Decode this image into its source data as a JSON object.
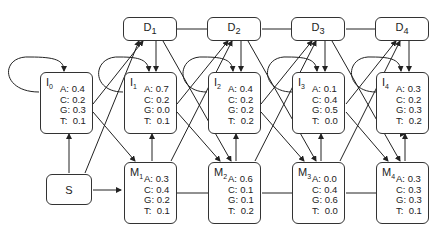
{
  "diagram": {
    "type": "profile-hmm",
    "start": {
      "label": "S"
    },
    "delete_states": [
      {
        "label": "D",
        "sub": "1"
      },
      {
        "label": "D",
        "sub": "2"
      },
      {
        "label": "D",
        "sub": "3"
      },
      {
        "label": "D",
        "sub": "4"
      }
    ],
    "insert_states": [
      {
        "label": "I",
        "sub": "0",
        "probs": {
          "A": "0.4",
          "C": "0.2",
          "G": "0.3",
          "T": "0.1"
        }
      },
      {
        "label": "I",
        "sub": "1",
        "probs": {
          "A": "0.7",
          "C": "0.2",
          "G": "0.0",
          "T": "0.1"
        }
      },
      {
        "label": "I",
        "sub": "2",
        "probs": {
          "A": "0.4",
          "C": "0.2",
          "G": "0.2",
          "T": "0.2"
        }
      },
      {
        "label": "I",
        "sub": "3",
        "probs": {
          "A": "0.1",
          "C": "0.4",
          "G": "0.5",
          "T": "0.0"
        }
      },
      {
        "label": "I",
        "sub": "4",
        "probs": {
          "A": "0.3",
          "C": "0.2",
          "G": "0.3",
          "T": "0.2"
        }
      }
    ],
    "match_states": [
      {
        "label": "M",
        "sub": "1",
        "probs": {
          "A": "0.3",
          "C": "0.4",
          "G": "0.2",
          "T": "0.1"
        }
      },
      {
        "label": "M",
        "sub": "2",
        "probs": {
          "A": "0.6",
          "C": "0.1",
          "G": "0.1",
          "T": "0.2"
        }
      },
      {
        "label": "M",
        "sub": "3",
        "probs": {
          "A": "0.0",
          "C": "0.4",
          "G": "0.6",
          "T": "0.0"
        }
      },
      {
        "label": "M",
        "sub": "4",
        "probs": {
          "A": "0.3",
          "C": "0.3",
          "G": "0.3",
          "T": "0.1"
        }
      }
    ],
    "prob_labels": {
      "A": "A:",
      "C": "C:",
      "G": "G:",
      "T": "T:"
    }
  }
}
